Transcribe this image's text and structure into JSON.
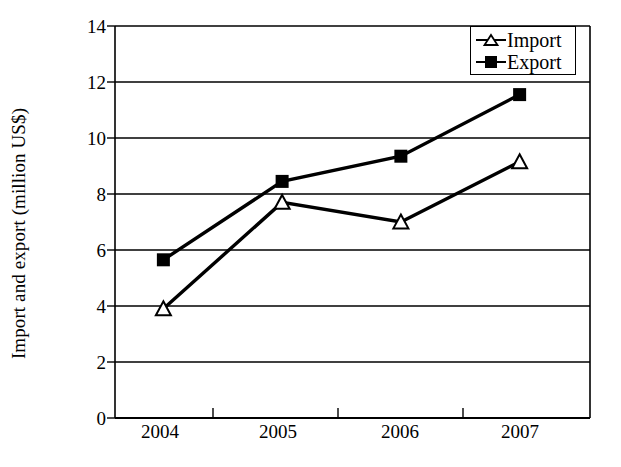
{
  "chart_data": {
    "type": "line",
    "title": "",
    "xlabel": "",
    "ylabel": "Import and export (million US$)",
    "categories": [
      "2004",
      "2005",
      "2006",
      "2007"
    ],
    "series": [
      {
        "name": "Import",
        "marker": "open-triangle",
        "values": [
          3.9,
          7.7,
          7.0,
          9.15
        ]
      },
      {
        "name": "Export",
        "marker": "filled-square",
        "values": [
          5.65,
          8.45,
          9.35,
          11.55
        ]
      }
    ],
    "ylim": [
      0,
      14
    ],
    "yticks": [
      "0",
      "2",
      "4",
      "6",
      "8",
      "10",
      "12",
      "14"
    ],
    "grid": "horizontal",
    "legend_position": "top-right",
    "colors": {
      "line": "#000000",
      "grid": "#000000",
      "background": "#ffffff"
    }
  },
  "legend": {
    "items": [
      {
        "label": "Import",
        "icon": "open-triangle-marker"
      },
      {
        "label": "Export",
        "icon": "filled-square-marker"
      }
    ]
  },
  "axes": {
    "y_title": "Import and export (million US$)",
    "y_tick_labels": [
      "14",
      "12",
      "10",
      "8",
      "6",
      "4",
      "2",
      "0"
    ],
    "x_tick_labels": [
      "2004",
      "2005",
      "2006",
      "2007"
    ]
  }
}
